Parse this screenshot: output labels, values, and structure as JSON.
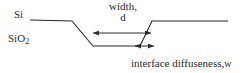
{
  "figure": {
    "labels": {
      "top_layer": "Si",
      "bottom_layer": "SiO",
      "bottom_layer_subscript": "2",
      "width_line1": "width,",
      "width_line2": "d",
      "diffuseness_text": "interface diffuseness,",
      "diffuseness_symbol": "w"
    },
    "colors": {
      "line": "#2b2b2b",
      "text": "#2a2a2a",
      "background": "#ffffff"
    }
  },
  "chart_data": {
    "type": "line",
    "title": "",
    "xlabel": "",
    "ylabel": "",
    "annotations": [
      {
        "name": "width-d",
        "label": "width, d",
        "arrow": "double-headed-horizontal",
        "x_start": 92,
        "x_end": 152,
        "y": 33
      },
      {
        "name": "interface-diffuseness-w",
        "label": "interface diffuseness, w",
        "arrow": "double-headed-horizontal",
        "x_start": 134,
        "x_end": 155,
        "y": 46
      }
    ],
    "series": [
      {
        "name": "interface-profile",
        "points": [
          [
            30,
            20
          ],
          [
            72,
            21
          ],
          [
            93,
            46
          ],
          [
            140,
            46
          ],
          [
            152,
            21
          ],
          [
            228,
            21
          ]
        ]
      }
    ]
  }
}
